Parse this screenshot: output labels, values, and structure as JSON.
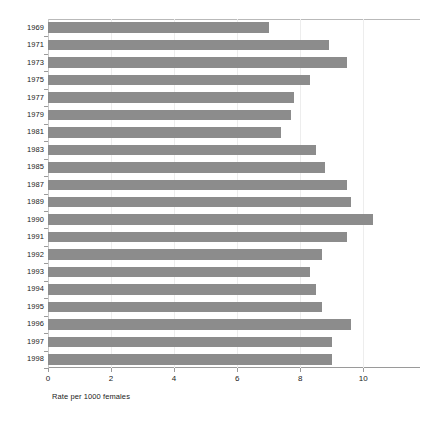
{
  "chart_data": {
    "type": "bar",
    "orientation": "horizontal",
    "title": "",
    "xlabel": "Rate per 1000 females",
    "ylabel": "",
    "categories": [
      "1969",
      "1971",
      "1973",
      "1975",
      "1977",
      "1979",
      "1981",
      "1983",
      "1985",
      "1987",
      "1989",
      "1990",
      "1991",
      "1992",
      "1993",
      "1994",
      "1995",
      "1996",
      "1997",
      "1998"
    ],
    "values": [
      7.0,
      8.9,
      9.5,
      8.3,
      7.8,
      7.7,
      7.4,
      8.5,
      8.8,
      9.5,
      9.6,
      10.3,
      9.5,
      8.7,
      8.3,
      8.5,
      8.7,
      9.6,
      9.0,
      9.0
    ],
    "xlim": [
      0,
      11.8
    ],
    "ylim": [
      0,
      20
    ],
    "xticks": [
      0,
      2,
      4,
      6,
      8,
      10
    ],
    "xtick_labels": [
      "0",
      "2",
      "4",
      "6",
      "8",
      "10"
    ],
    "grid": true,
    "grid_axis": "x",
    "legend": false,
    "bar_color": "#8c8c8c",
    "axis_color": "#9a9a9a",
    "grid_color": "#ededed",
    "text_color": "#1b1b1b",
    "background": "#ffffff"
  }
}
